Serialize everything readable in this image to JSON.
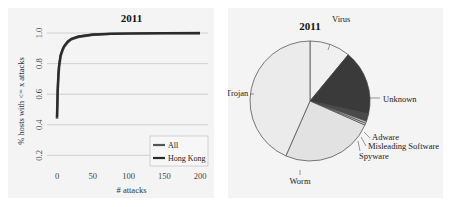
{
  "left_chart": {
    "title": "2011",
    "xlabel": "# attacks",
    "ylabel": "% hosts with <= x attacks",
    "legend": [
      "All",
      "Hong Kong"
    ]
  },
  "right_chart": {
    "title": "2011"
  },
  "chart_data": [
    {
      "type": "line",
      "title": "2011",
      "xlabel": "# attacks",
      "ylabel": "% hosts with <= x attacks",
      "xlim": [
        0,
        200
      ],
      "ylim": [
        0.15,
        1.02
      ],
      "xticks": [
        0,
        50,
        100,
        150,
        200
      ],
      "yticks": [
        0.2,
        0.4,
        0.6,
        0.8,
        1.0
      ],
      "grid": true,
      "legend_position": "lower right",
      "series": [
        {
          "name": "All",
          "color": "#555555",
          "x": [
            0,
            1,
            2,
            3,
            5,
            8,
            10,
            15,
            20,
            30,
            50,
            75,
            100,
            150,
            200
          ],
          "y": [
            0.44,
            0.62,
            0.72,
            0.78,
            0.85,
            0.89,
            0.91,
            0.94,
            0.96,
            0.975,
            0.99,
            0.995,
            0.997,
            0.999,
            1.0
          ]
        },
        {
          "name": "Hong Kong",
          "color": "#2a2a2a",
          "x": [
            0,
            1,
            2,
            3,
            5,
            8,
            10,
            15,
            20,
            30,
            50,
            75,
            100,
            150,
            200
          ],
          "y": [
            0.45,
            0.63,
            0.73,
            0.79,
            0.855,
            0.895,
            0.915,
            0.945,
            0.962,
            0.978,
            0.99,
            0.995,
            0.997,
            0.999,
            1.0
          ]
        }
      ]
    },
    {
      "type": "pie",
      "title": "2011",
      "start_angle": "top, clockwise",
      "categories": [
        "Virus",
        "Unknown",
        "Adware",
        "Misleading Software",
        "Spyware",
        "Worm",
        "Trojan"
      ],
      "values": [
        11.0,
        17.5,
        2.0,
        0.6,
        0.5,
        25.0,
        43.4
      ],
      "colors": [
        "#f0f0f0",
        "#3a3a3a",
        "#4a4a4a",
        "#bdbdbd",
        "#dddddd",
        "#e2e2e2",
        "#ebebeb"
      ]
    }
  ]
}
